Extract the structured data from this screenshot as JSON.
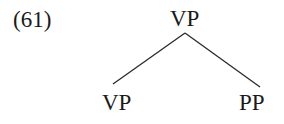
{
  "example_number": "(61)",
  "tree": {
    "root": "VP",
    "children": [
      {
        "label": "VP"
      },
      {
        "label": "PP"
      }
    ]
  },
  "colors": {
    "ink": "#1a1a1a",
    "background": "#ffffff"
  }
}
